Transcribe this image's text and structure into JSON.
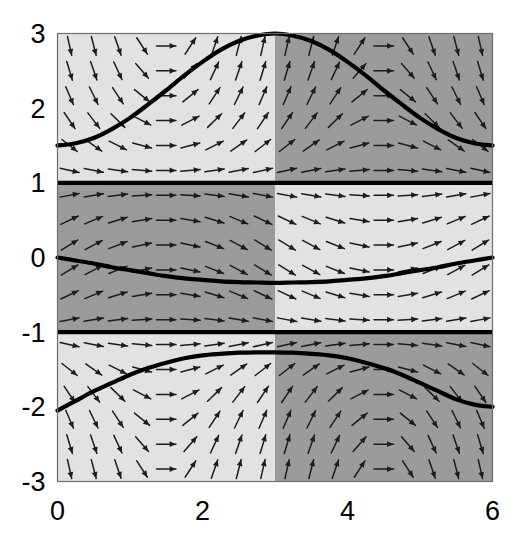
{
  "figure": {
    "title": "",
    "background_color": "#ffffff"
  },
  "chart_data": {
    "type": "line",
    "title": "",
    "subtitle": "",
    "xlabel": "",
    "ylabel": "",
    "xlim": [
      0,
      6
    ],
    "ylim": [
      -3,
      3
    ],
    "xticks": [
      0,
      2,
      4,
      6
    ],
    "xtick_labels": [
      "0",
      "2",
      "4",
      "6"
    ],
    "yticks": [
      3,
      2,
      1,
      0,
      -1,
      -2,
      -3
    ],
    "ytick_labels": [
      "3",
      "2",
      "1",
      "0",
      "-1",
      "-2",
      "-3"
    ],
    "grid": false,
    "legend": null,
    "legend_position": "none",
    "plot_kind": "direction-field-with-solution-curves",
    "slope_field": {
      "description": "arrow vector field, dy/dx = (y^2 - 1) * cos(x) style sign structure",
      "x_samples": 18,
      "y_samples": 18,
      "arrow_color": "#1c1c1c"
    },
    "shading": {
      "description": "four-quadrant sign regions split at x=3 and at y=1 and y=-1",
      "light_gray": "#e2e2e2",
      "dark_gray": "#9b9b9b",
      "regions": [
        {
          "x_range": [
            0,
            3
          ],
          "y_range": [
            1,
            3
          ],
          "shade": "light"
        },
        {
          "x_range": [
            3,
            6
          ],
          "y_range": [
            1,
            3
          ],
          "shade": "dark"
        },
        {
          "x_range": [
            0,
            3
          ],
          "y_range": [
            -1,
            1
          ],
          "shade": "dark"
        },
        {
          "x_range": [
            3,
            6
          ],
          "y_range": [
            -1,
            1
          ],
          "shade": "light"
        },
        {
          "x_range": [
            0,
            3
          ],
          "y_range": [
            -3,
            -1
          ],
          "shade": "light"
        },
        {
          "x_range": [
            3,
            6
          ],
          "y_range": [
            -3,
            -1
          ],
          "shade": "dark"
        }
      ]
    },
    "equilibria": [
      {
        "label": "y = 1",
        "y": 1
      },
      {
        "label": "y = -1",
        "y": -1
      }
    ],
    "series": [
      {
        "name": "upper solution curve",
        "color": "#000000",
        "x": [
          0.0,
          0.25,
          0.5,
          0.75,
          1.0,
          1.25,
          1.5,
          1.75,
          2.0,
          2.25,
          2.5,
          2.75,
          3.0,
          3.25,
          3.5,
          3.75,
          4.0,
          4.25,
          4.5,
          4.75,
          5.0,
          5.25,
          5.5,
          5.75,
          6.0
        ],
        "y": [
          1.5,
          1.53,
          1.6,
          1.72,
          1.87,
          2.05,
          2.24,
          2.44,
          2.62,
          2.78,
          2.9,
          2.97,
          3.0,
          2.97,
          2.9,
          2.78,
          2.62,
          2.44,
          2.24,
          2.05,
          1.87,
          1.72,
          1.6,
          1.53,
          1.5
        ]
      },
      {
        "name": "middle solution curve",
        "color": "#000000",
        "x": [
          0.0,
          0.25,
          0.5,
          0.75,
          1.0,
          1.25,
          1.5,
          1.75,
          2.0,
          2.25,
          2.5,
          2.75,
          3.0,
          3.25,
          3.5,
          3.75,
          4.0,
          4.25,
          4.5,
          4.75,
          5.0,
          5.25,
          5.5,
          5.75,
          6.0
        ],
        "y": [
          0.0,
          -0.04,
          -0.08,
          -0.13,
          -0.17,
          -0.21,
          -0.25,
          -0.28,
          -0.3,
          -0.32,
          -0.33,
          -0.335,
          -0.34,
          -0.335,
          -0.33,
          -0.32,
          -0.3,
          -0.28,
          -0.25,
          -0.21,
          -0.17,
          -0.13,
          -0.08,
          -0.04,
          0.0
        ]
      },
      {
        "name": "lower solution curve",
        "color": "#000000",
        "x": [
          0.0,
          0.25,
          0.5,
          0.75,
          1.0,
          1.25,
          1.5,
          1.75,
          2.0,
          2.25,
          2.5,
          2.75,
          3.0,
          3.25,
          3.5,
          3.75,
          4.0,
          4.25,
          4.5,
          4.75,
          5.0,
          5.25,
          5.5,
          5.75,
          6.0
        ],
        "y": [
          -2.05,
          -1.92,
          -1.79,
          -1.68,
          -1.57,
          -1.48,
          -1.41,
          -1.35,
          -1.31,
          -1.29,
          -1.275,
          -1.27,
          -1.27,
          -1.275,
          -1.29,
          -1.31,
          -1.35,
          -1.41,
          -1.48,
          -1.57,
          -1.68,
          -1.79,
          -1.9,
          -1.97,
          -2.0
        ]
      }
    ]
  },
  "axes": {
    "frame_color": "#6e6e6e",
    "tick_font_size": 27
  }
}
